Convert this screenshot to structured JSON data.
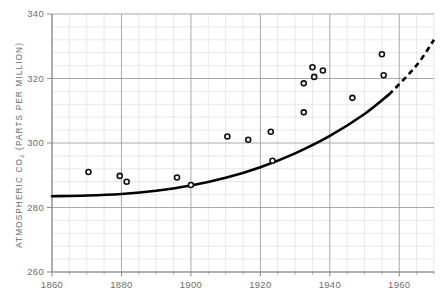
{
  "chart_data": {
    "type": "scatter",
    "title": "",
    "subtitle": "",
    "xlabel": "",
    "ylabel": "ATMOSPHERIC CO2 (PARTS PER MILLION)",
    "ylabel_parts": {
      "pre": "ATMOSPHERIC  CO",
      "sub": "2",
      "post": "  (PARTS  PER  MILLION)"
    },
    "xlim": [
      1860,
      1970
    ],
    "ylim": [
      260,
      340
    ],
    "x_major_ticks": [
      1860,
      1880,
      1900,
      1920,
      1940,
      1960
    ],
    "x_tick_labels": [
      "1860",
      "1880",
      "1900",
      "1920",
      "1940",
      "1960"
    ],
    "x_minor_step": 5,
    "y_major_ticks": [
      260,
      280,
      300,
      320,
      340
    ],
    "y_tick_labels": [
      "260",
      "280",
      "300",
      "320",
      "340"
    ],
    "y_minor_step": 4,
    "grid": true,
    "legend": "none",
    "series": [
      {
        "name": "Observations",
        "type": "scatter",
        "marker": "open-circle",
        "color": "#111111",
        "points": [
          {
            "x": 1870.5,
            "y": 291.0
          },
          {
            "x": 1879.5,
            "y": 289.8
          },
          {
            "x": 1881.5,
            "y": 288.0
          },
          {
            "x": 1896.0,
            "y": 289.3
          },
          {
            "x": 1900.0,
            "y": 287.0
          },
          {
            "x": 1910.5,
            "y": 302.0
          },
          {
            "x": 1916.5,
            "y": 301.0
          },
          {
            "x": 1923.0,
            "y": 303.5
          },
          {
            "x": 1923.5,
            "y": 294.5
          },
          {
            "x": 1932.5,
            "y": 318.5
          },
          {
            "x": 1932.5,
            "y": 309.5
          },
          {
            "x": 1935.0,
            "y": 323.5
          },
          {
            "x": 1935.5,
            "y": 320.5
          },
          {
            "x": 1938.0,
            "y": 322.5
          },
          {
            "x": 1946.5,
            "y": 314.0
          },
          {
            "x": 1955.0,
            "y": 327.5
          },
          {
            "x": 1955.5,
            "y": 321.0
          }
        ]
      },
      {
        "name": "Fitted trend (solid)",
        "type": "line",
        "style": "solid",
        "color": "#000000",
        "points": [
          {
            "x": 1860,
            "y": 283.5
          },
          {
            "x": 1870,
            "y": 283.7
          },
          {
            "x": 1880,
            "y": 284.2
          },
          {
            "x": 1890,
            "y": 285.2
          },
          {
            "x": 1900,
            "y": 286.8
          },
          {
            "x": 1910,
            "y": 289.2
          },
          {
            "x": 1920,
            "y": 292.5
          },
          {
            "x": 1930,
            "y": 296.8
          },
          {
            "x": 1940,
            "y": 302.2
          },
          {
            "x": 1950,
            "y": 309.0
          },
          {
            "x": 1957,
            "y": 315.0
          }
        ]
      },
      {
        "name": "Projected trend (dashed)",
        "type": "line",
        "style": "dashed",
        "color": "#000000",
        "points": [
          {
            "x": 1957,
            "y": 315.0
          },
          {
            "x": 1962,
            "y": 320.5
          },
          {
            "x": 1966,
            "y": 325.5
          },
          {
            "x": 1970,
            "y": 332.0
          }
        ]
      }
    ]
  },
  "colors": {
    "grid_minor": "#d9d9d9",
    "grid_major": "#9a9a9a",
    "axis": "#8c8c8c",
    "curve": "#000000",
    "marker": "#111111",
    "text": "#6b6b6b",
    "background": "#ffffff"
  }
}
